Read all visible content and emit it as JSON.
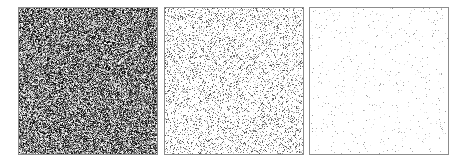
{
  "figure": {
    "width": 467,
    "height": 164,
    "background": "#ffffff",
    "border_color": "#8c8c8c",
    "panels": [
      {
        "id": "dense-noise",
        "description": "Dense grayscale random noise",
        "x": 18,
        "y": 7,
        "w": 140,
        "h": 148,
        "density": 1.0,
        "gray_min": 0,
        "gray_max": 255,
        "seed": 11
      },
      {
        "id": "sparse-noise",
        "description": "Sparse gray speckle noise on white",
        "x": 164,
        "y": 7,
        "w": 140,
        "h": 148,
        "density": 0.22,
        "gray_min": 70,
        "gray_max": 230,
        "seed": 23
      },
      {
        "id": "very-sparse-noise",
        "description": "Very sparse faint speckles on white",
        "x": 309,
        "y": 7,
        "w": 140,
        "h": 148,
        "density": 0.025,
        "gray_min": 150,
        "gray_max": 235,
        "seed": 37
      }
    ]
  }
}
